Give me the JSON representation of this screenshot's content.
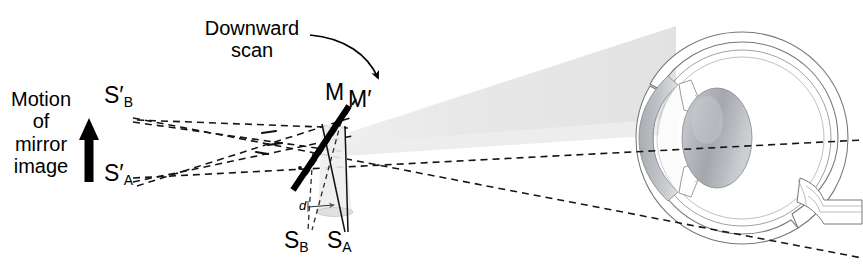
{
  "figure": {
    "domain": "Diagram",
    "type": "optical-ray-diagram",
    "title_visible": false,
    "width": 863,
    "height": 276,
    "background": "#ffffff"
  },
  "labels": {
    "motion_line1": "Motion",
    "motion_line2": "of",
    "motion_line3": "mirror",
    "motion_line4": "image",
    "scan_line1": "Downward",
    "scan_line2": "scan",
    "mirror_current": "M",
    "mirror_shifted": "M",
    "mirror_shifted_prime": "′",
    "source_virtual_b": "S",
    "source_virtual_b_prime": "′",
    "source_virtual_b_sub": "B",
    "source_virtual_a": "S",
    "source_virtual_a_prime": "′",
    "source_virtual_a_sub": "A",
    "source_real_b": "S",
    "source_real_b_sub": "B",
    "source_real_a": "S",
    "source_real_a_sub": "A",
    "separation": "d"
  },
  "colors": {
    "ink": "#000000",
    "beam_fill": "#e8e8e8",
    "beam_fill_light": "#f1f1f1",
    "cone_fill": "#ededed",
    "eye_outline": "#6f7277",
    "eye_inner": "#9a9ea3",
    "cornea_gray": "#b9bcc0",
    "lens_light": "#e3e5e7",
    "lens_dark": "#9ea2a6",
    "dashed_ray": "#1a1a1a"
  },
  "elements": {
    "mirror_solid": {
      "name": "mirror-M",
      "x1": 347,
      "y1": 108,
      "x2": 294,
      "y2": 188,
      "stroke_width": 6
    },
    "mirror_dashed": {
      "name": "mirror-M-prime",
      "x1": 355,
      "y1": 100,
      "x2": 302,
      "y2": 180
    },
    "motion_arrow": {
      "direction": "up",
      "x": 88,
      "y_top": 122,
      "y_bottom": 182
    },
    "scan_arrow": {
      "direction": "curved-down-right",
      "from_x": 316,
      "from_y": 38,
      "to_x": 372,
      "to_y": 78
    },
    "separation_arrow": {
      "label": "d",
      "x1": 310,
      "y1": 208,
      "x2": 334,
      "y2": 206
    }
  },
  "ray_paths": {
    "virtual_source_b": {
      "x": 118,
      "y": 110
    },
    "virtual_source_a": {
      "x": 118,
      "y": 183
    },
    "real_source_b": {
      "x": 309,
      "y": 238
    },
    "real_source_a": {
      "x": 348,
      "y": 238
    },
    "note": "Two dashed rays emanate from each virtual source, crossing in an X pattern at the mirror and continuing through the eye"
  },
  "eye": {
    "name": "human-eye-cross-section",
    "center_x": 742,
    "center_y": 138,
    "radius": 106,
    "parts": [
      "sclera",
      "choroid",
      "retina",
      "cornea",
      "lens",
      "iris",
      "optic-nerve"
    ],
    "optic_nerve": {
      "exit_x": 818,
      "exit_y": 196,
      "direction": "lower-right"
    }
  },
  "beam": {
    "name": "scanning-light-beam",
    "apex_x": 345,
    "apex_y": 150,
    "wide_end_x": 672,
    "wide_top_y": 28,
    "wide_bottom_y": 128
  }
}
